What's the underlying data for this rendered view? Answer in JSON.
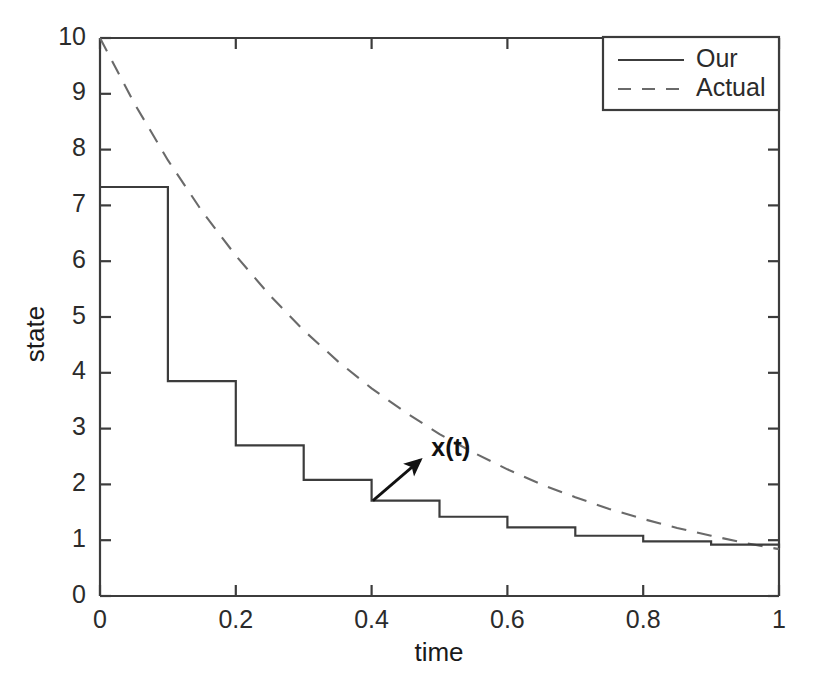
{
  "chart_data": {
    "type": "line",
    "title": "",
    "xlabel": "time",
    "ylabel": "state",
    "xlim": [
      0,
      1
    ],
    "ylim": [
      0,
      10
    ],
    "grid": false,
    "legend_position": "top-right",
    "xticks": [
      0,
      0.2,
      0.4,
      0.6,
      0.8,
      1
    ],
    "xtick_labels": [
      "0",
      "0.2",
      "0.4",
      "0.6",
      "0.8",
      "1"
    ],
    "yticks": [
      0,
      1,
      2,
      3,
      4,
      5,
      6,
      7,
      8,
      9,
      10
    ],
    "ytick_labels": [
      "0",
      "1",
      "2",
      "3",
      "4",
      "5",
      "6",
      "7",
      "8",
      "9",
      "10"
    ],
    "annotations": [
      {
        "text": "x(t)",
        "label_x": 0.488,
        "label_y": 2.62,
        "arrow_tail_x": 0.402,
        "arrow_tail_y": 1.71,
        "arrow_head_x": 0.472,
        "arrow_head_y": 2.44
      }
    ],
    "series": [
      {
        "name": "Our",
        "style": "solid",
        "color": "#3c3c3c",
        "kind": "step-post",
        "x": [
          0.0,
          0.1,
          0.2,
          0.3,
          0.4,
          0.5,
          0.6,
          0.7,
          0.8,
          0.9,
          1.0
        ],
        "values": [
          7.33,
          3.85,
          2.7,
          2.08,
          1.71,
          1.42,
          1.23,
          1.08,
          0.98,
          0.92,
          0.86
        ]
      },
      {
        "name": "Actual",
        "style": "dashed",
        "color": "#6a6a6a",
        "kind": "curve",
        "x": [
          0.0,
          0.05,
          0.1,
          0.15,
          0.2,
          0.25,
          0.3,
          0.35,
          0.4,
          0.45,
          0.5,
          0.55,
          0.6,
          0.65,
          0.7,
          0.75,
          0.8,
          0.85,
          0.9,
          0.95,
          1.0
        ],
        "values": [
          10.0,
          8.84,
          7.81,
          6.9,
          6.1,
          5.39,
          4.76,
          4.21,
          3.72,
          3.29,
          2.9,
          2.57,
          2.27,
          2.0,
          1.77,
          1.56,
          1.38,
          1.22,
          1.08,
          0.95,
          0.84
        ]
      }
    ]
  },
  "axis_title_x": "time",
  "axis_title_y": "state",
  "legend": {
    "items": [
      {
        "label": "Our",
        "style": "solid"
      },
      {
        "label": "Actual",
        "style": "dashed"
      }
    ]
  },
  "colors": {
    "axis": "#3c3c3c",
    "our_line": "#3c3c3c",
    "actual_line": "#6a6a6a",
    "text": "#1a1a1a",
    "background": "#ffffff"
  }
}
